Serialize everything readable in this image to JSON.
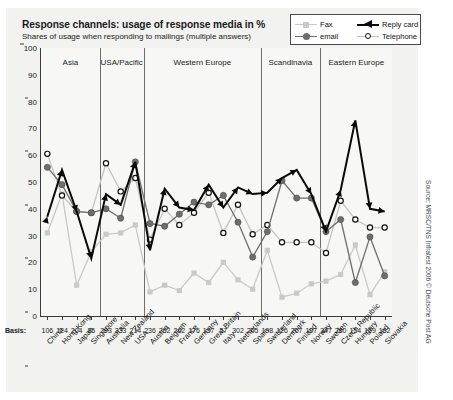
{
  "header": {
    "title": "Response channels: usage of response media in %",
    "subtitle": "Shares of usage when responding to mailings (multiple answers)"
  },
  "legend": {
    "items": [
      {
        "label": "Fax",
        "icon": "square-marker-icon",
        "color": "#c9c9c9"
      },
      {
        "label": "email",
        "icon": "circle-marker-icon",
        "color": "#6e6e6e"
      },
      {
        "label": "Reply card",
        "icon": "arrow-marker-icon",
        "color": "#0a0a0a"
      },
      {
        "label": "Telephone",
        "icon": "open-circle-marker-icon",
        "color": "#111111"
      }
    ]
  },
  "axis": {
    "basis_label": "Basis:",
    "y_ticks": [
      0,
      10,
      20,
      30,
      40,
      50,
      60,
      70,
      80,
      90,
      100
    ]
  },
  "source": "Source: MRSC/TNS Infratest 2006 © Deutsche Post AG",
  "regions": [
    {
      "label": "Asia",
      "start": 0,
      "end": 4
    },
    {
      "label": "USA/Pacific",
      "start": 4,
      "end": 7
    },
    {
      "label": "Western Europe",
      "start": 7,
      "end": 15
    },
    {
      "label": "Scandinavia",
      "start": 15,
      "end": 19
    },
    {
      "label": "Eastern Europe",
      "start": 19,
      "end": 24
    }
  ],
  "chart_data": {
    "type": "line",
    "title": "Response channels: usage of response media in %",
    "subtitle": "Shares of usage when responding to mailings (multiple answers)",
    "xlabel": "",
    "ylabel": "%",
    "ylim": [
      0,
      100
    ],
    "ytick_step": 10,
    "grid": false,
    "legend_position": "top-right",
    "categories": [
      "China",
      "Hong Kong",
      "Japan",
      "Singapore",
      "Australia",
      "New Zealand",
      "USA",
      "Austria",
      "Belgium",
      "France",
      "Germany",
      "Great Britain",
      "Italy",
      "Netherlands",
      "Spain",
      "Switzerland",
      "Denmark",
      "Finland",
      "Norway",
      "Sweden",
      "Czech Republic",
      "Hungary",
      "Poland",
      "Slovakia"
    ],
    "basis": [
      106,
      124,
      204,
      86,
      293,
      333,
      214,
      236,
      262,
      262,
      176,
      157,
      57,
      302,
      205,
      198,
      126,
      267,
      197,
      347,
      260,
      154,
      159,
      162
    ],
    "series": [
      {
        "name": "Fax",
        "color": "#c9c9c9",
        "values": [
          31,
          45.5,
          11.5,
          24,
          30.5,
          31,
          34,
          9,
          11.5,
          9.5,
          16,
          12.5,
          20,
          13.5,
          10,
          24.5,
          7,
          8.5,
          12,
          13,
          15.5,
          26.5,
          8,
          16.5
        ]
      },
      {
        "name": "email",
        "color": "#6e6e6e",
        "values": [
          55.5,
          49,
          39,
          38.5,
          40,
          36.5,
          57.5,
          34.5,
          33.5,
          38,
          42.5,
          41.5,
          45,
          35,
          22,
          31.5,
          50.5,
          44,
          44,
          31.5,
          36,
          12.5,
          29.5,
          15
        ]
      },
      {
        "name": "Reply card",
        "color": "#0a0a0a",
        "values": [
          37,
          54.5,
          39,
          21.5,
          45.5,
          41.5,
          57.5,
          24.5,
          47.5,
          40.5,
          39.5,
          49,
          40.5,
          48,
          45.5,
          46,
          51.5,
          54.5,
          45.5,
          31.5,
          47,
          73,
          40,
          39
        ]
      },
      {
        "name": "Telephone",
        "color": "#111111",
        "values": [
          60.5,
          45,
          39,
          38.5,
          57,
          46.5,
          51.5,
          28.5,
          40,
          34,
          38.5,
          46,
          31,
          41.5,
          30.5,
          34,
          27.5,
          27.5,
          27.5,
          23.5,
          43,
          36,
          33,
          33
        ]
      }
    ]
  }
}
